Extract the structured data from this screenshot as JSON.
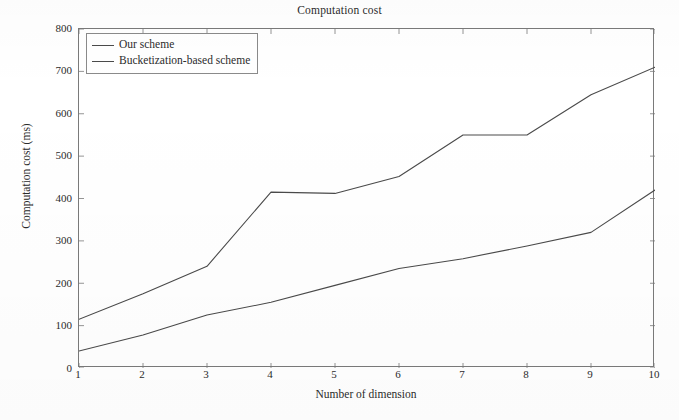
{
  "chart_data": {
    "type": "line",
    "title": "Computation cost",
    "xlabel": "Number of dimension",
    "ylabel": "Computation cost (ms)",
    "x": [
      1,
      2,
      3,
      4,
      5,
      6,
      7,
      8,
      9,
      10
    ],
    "xlim": [
      1,
      10
    ],
    "ylim": [
      0,
      800
    ],
    "xticks": [
      "1",
      "2",
      "3",
      "4",
      "5",
      "6",
      "7",
      "8",
      "9",
      "10"
    ],
    "yticks": [
      "0",
      "100",
      "200",
      "300",
      "400",
      "500",
      "600",
      "700",
      "800"
    ],
    "grid": false,
    "legend_position": "upper left",
    "series": [
      {
        "name": "Our scheme",
        "color": "#4a4a4a",
        "values": [
          40,
          78,
          125,
          155,
          195,
          235,
          258,
          288,
          320,
          420
        ]
      },
      {
        "name": "Bucketization-based scheme",
        "color": "#4a4a4a",
        "values": [
          115,
          175,
          240,
          415,
          412,
          452,
          550,
          550,
          645,
          710
        ]
      }
    ]
  },
  "axes": {
    "y_tick_labels": [
      "800",
      "700",
      "600",
      "500",
      "400",
      "300",
      "200",
      "100",
      "0"
    ],
    "x_tick_labels": [
      "1",
      "2",
      "3",
      "4",
      "5",
      "6",
      "7",
      "8",
      "9",
      "10"
    ]
  },
  "legend": {
    "entries": [
      {
        "label": "Our scheme"
      },
      {
        "label": "Bucketization-based scheme"
      }
    ]
  },
  "style": {
    "line_color": "#4a4a4a",
    "axis_color": "#7a7a7a",
    "text_color": "#2b2b2b",
    "background": "#ffffff"
  }
}
